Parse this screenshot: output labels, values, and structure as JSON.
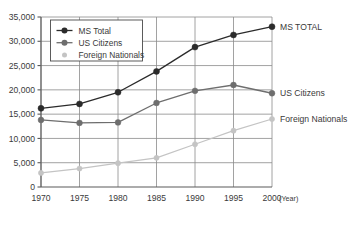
{
  "chart_data": {
    "type": "line",
    "title": "",
    "xlabel": "(Year)",
    "ylabel": "",
    "x": [
      1970,
      1975,
      1980,
      1985,
      1990,
      1995,
      2000
    ],
    "categories": [
      "1970",
      "1975",
      "1980",
      "1985",
      "1990",
      "1995",
      "2000"
    ],
    "xlim": [
      1970,
      2000
    ],
    "ylim": [
      0,
      35000
    ],
    "yticks": [
      0,
      5000,
      10000,
      15000,
      20000,
      25000,
      30000,
      35000
    ],
    "ytick_labels": [
      "0",
      "5,000",
      "10,000",
      "15,000",
      "20,000",
      "25,000",
      "30,000",
      "35,000"
    ],
    "grid": true,
    "legend_position": "upper-left-inside",
    "series": [
      {
        "name": "MS Total",
        "end_label": "MS TOTAL",
        "color": "#2b2b2b",
        "values": [
          16200,
          17100,
          19500,
          23800,
          28800,
          31300,
          33000
        ]
      },
      {
        "name": "US Citizens",
        "end_label": "US Citizens",
        "color": "#6e6e6e",
        "values": [
          13800,
          13200,
          13300,
          17300,
          19800,
          21000,
          19300
        ]
      },
      {
        "name": "Foreign Nationals",
        "end_label": "Foreign Nationals",
        "color": "#c4c4c4",
        "values": [
          2900,
          3800,
          4900,
          6000,
          8800,
          11600,
          14000
        ]
      }
    ]
  },
  "legend": {
    "items": [
      {
        "label": "MS Total"
      },
      {
        "label": "US Citizens"
      },
      {
        "label": "Foreign Nationals"
      }
    ]
  },
  "axis": {
    "x_unit_label": "(Year)"
  }
}
